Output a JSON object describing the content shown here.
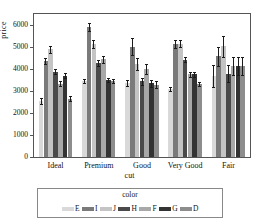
{
  "chart_data": {
    "type": "bar",
    "title": "",
    "xlabel": "cut",
    "ylabel": "price",
    "categories": [
      "Ideal",
      "Premium",
      "Good",
      "Very Good",
      "Fair"
    ],
    "ylim": [
      0,
      6500
    ],
    "yticks": [
      0,
      1000,
      2000,
      3000,
      4000,
      5000,
      6000
    ],
    "ytick_labels": [
      "0",
      "1000",
      "2000",
      "3000",
      "4000",
      "5000",
      "6000"
    ],
    "grid": false,
    "legend_title": "color",
    "legend_position": "bottom",
    "error_bars": true,
    "series": [
      {
        "name": "E",
        "color": "#d9d9d9",
        "values": [
          2550,
          3470,
          3350,
          3100,
          3680
        ],
        "err_low": [
          2420,
          3380,
          3230,
          3010,
          3200
        ],
        "err_high": [
          2680,
          3560,
          3480,
          3200,
          4180
        ]
      },
      {
        "name": "I",
        "color": "#7a7a7a",
        "values": [
          4370,
          5900,
          5010,
          5130,
          4570
        ],
        "err_low": [
          4230,
          5730,
          4650,
          4960,
          4120
        ],
        "err_high": [
          4510,
          6080,
          5390,
          5300,
          5020
        ]
      },
      {
        "name": "J",
        "color": "#c4c4c4",
        "values": [
          4900,
          5120,
          4210,
          5150,
          5030
        ],
        "err_low": [
          4730,
          4940,
          3940,
          4980,
          4550
        ],
        "err_high": [
          5060,
          5300,
          4480,
          5320,
          5500
        ]
      },
      {
        "name": "H",
        "color": "#4a4a4a",
        "values": [
          3880,
          4280,
          3440,
          4430,
          3780
        ],
        "err_low": [
          3780,
          4130,
          3290,
          4300,
          3400
        ],
        "err_high": [
          3990,
          4430,
          3590,
          4560,
          4160
        ]
      },
      {
        "name": "F",
        "color": "#a8a8a8",
        "values": [
          3340,
          4440,
          4010,
          3760,
          4130
        ],
        "err_low": [
          3230,
          4290,
          3790,
          3640,
          3730
        ],
        "err_high": [
          3450,
          4590,
          4230,
          3880,
          4530
        ]
      },
      {
        "name": "G",
        "color": "#333333",
        "values": [
          3700,
          3500,
          3350,
          3760,
          4130
        ],
        "err_low": [
          3590,
          3400,
          3180,
          3640,
          3730
        ],
        "err_high": [
          3810,
          3610,
          3520,
          3880,
          4530
        ]
      },
      {
        "name": "D",
        "color": "#8d8d8d",
        "values": [
          2650,
          3470,
          3290,
          3330,
          4130
        ],
        "err_low": [
          2540,
          3380,
          3120,
          3230,
          3730
        ],
        "err_high": [
          2760,
          3560,
          3460,
          3430,
          4530
        ]
      }
    ]
  },
  "axes": {
    "y_title": "price",
    "x_title": "cut",
    "x_categories": [
      "Ideal",
      "Premium",
      "Good",
      "Very Good",
      "Fair"
    ]
  },
  "legend": {
    "title": "color",
    "entries": [
      {
        "label": "E",
        "color": "#d9d9d9"
      },
      {
        "label": "I",
        "color": "#7a7a7a"
      },
      {
        "label": "J",
        "color": "#c4c4c4"
      },
      {
        "label": "H",
        "color": "#4a4a4a"
      },
      {
        "label": "F",
        "color": "#a8a8a8"
      },
      {
        "label": "G",
        "color": "#333333"
      },
      {
        "label": "D",
        "color": "#8d8d8d"
      }
    ]
  }
}
